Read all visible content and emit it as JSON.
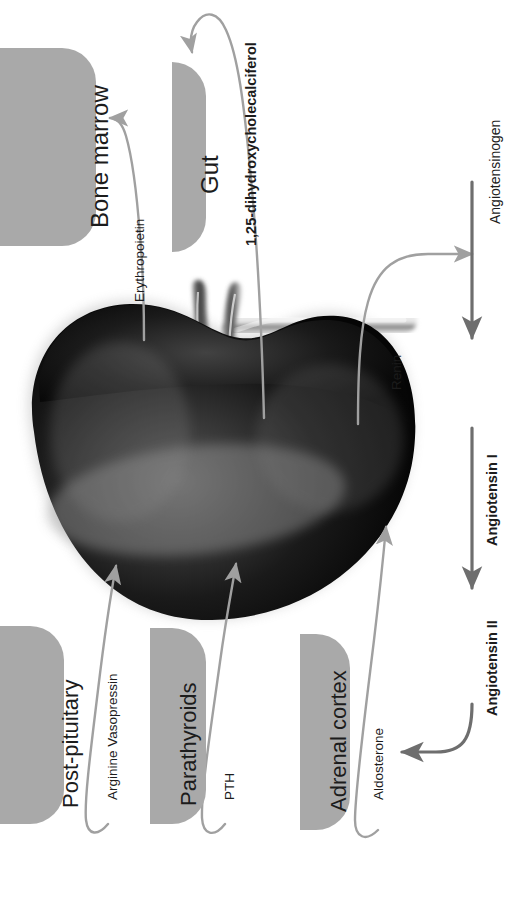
{
  "diagram": {
    "organ": "kidney",
    "orientation": "rotated-90",
    "colors": {
      "plate": "#a9a9a9",
      "connector": "#a0a0a0",
      "connector_dark": "#6e6e6e",
      "text": "#1c1c1c",
      "background": "#ffffff"
    }
  },
  "organs": [
    {
      "id": "bone-marrow",
      "label": "Bone marrow"
    },
    {
      "id": "gut",
      "label": "Gut"
    },
    {
      "id": "post-pituitary",
      "label": "Post-pituitary"
    },
    {
      "id": "parathyroids",
      "label": "Parathyroids"
    },
    {
      "id": "adrenal-cortex",
      "label": "Adrenal cortex"
    }
  ],
  "hormones": [
    {
      "id": "erythropoietin",
      "label": "Erythropoietin",
      "bold": false,
      "from": "kidney",
      "to": "bone-marrow"
    },
    {
      "id": "calcitriol",
      "label": "1,25-dihydroxycholecalciferol",
      "bold": true,
      "from": "kidney",
      "to": "gut"
    },
    {
      "id": "renin",
      "label": "Renin",
      "bold": false,
      "from": "kidney",
      "to": "angiotensinogen"
    },
    {
      "id": "avp",
      "label": "Arginine Vasopressin",
      "bold": false,
      "from": "post-pituitary",
      "to": "kidney"
    },
    {
      "id": "pth",
      "label": "PTH",
      "bold": false,
      "from": "parathyroids",
      "to": "kidney"
    },
    {
      "id": "aldosterone",
      "label": "Aldosterone",
      "bold": false,
      "from": "adrenal-cortex",
      "to": "kidney"
    }
  ],
  "cascade": [
    {
      "id": "angiotensinogen",
      "label": "Angiotensinogen",
      "bold": false
    },
    {
      "id": "angiotensin-1",
      "label": "Angiotensin I",
      "bold": true
    },
    {
      "id": "angiotensin-2",
      "label": "Angiotensin II",
      "bold": true
    }
  ]
}
